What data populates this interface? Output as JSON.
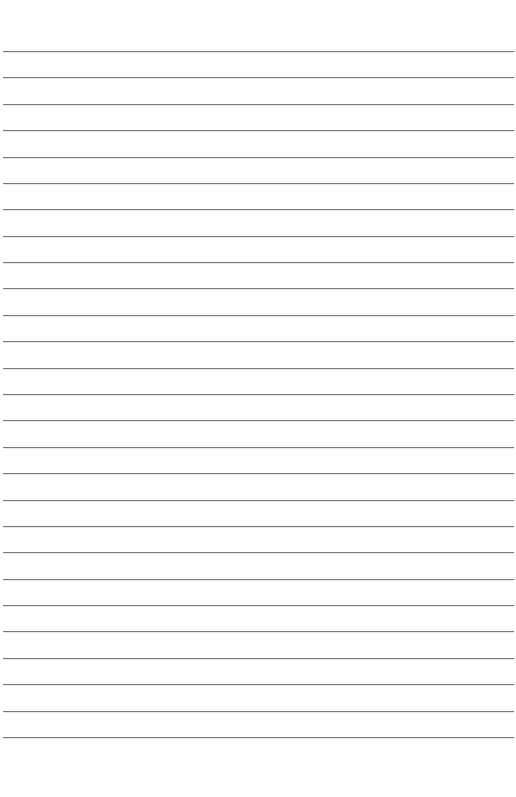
{
  "page": {
    "type": "lined-paper",
    "background_color": "#ffffff",
    "line_color": "#7a7a7a",
    "line_count": 27,
    "first_line_y": 51,
    "last_line_y": 737,
    "line_spacing_px": 26.38,
    "text": []
  }
}
